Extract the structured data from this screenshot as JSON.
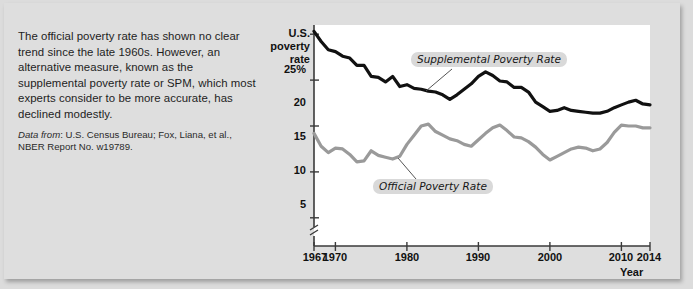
{
  "blurb": {
    "body": "The official poverty rate has shown no clear trend since the late 1960s. However, an alternative measure, known as the supplemental poverty rate or SPM, which most experts consider to be more accurate, has declined modestly.",
    "source_lead": "Data from",
    "source_rest": ": U.S. Census Bureau; Fox, Liana, et al., NBER Report  No. w19789."
  },
  "chart_data": {
    "type": "line",
    "title": "U.S. poverty rate",
    "title_lines": [
      "U.S.",
      "poverty",
      "rate"
    ],
    "xlabel": "Year",
    "ylabel": "U.S. poverty rate",
    "ylim": [
      4,
      26
    ],
    "xlim": [
      1967,
      2014
    ],
    "grid": false,
    "y_axis_break": true,
    "legend_position": "inline-callouts",
    "ytick_labels": [
      "25%",
      "20",
      "15",
      "10",
      "5"
    ],
    "ytick_values": [
      25,
      20,
      15,
      10,
      5
    ],
    "xtick_labels": [
      "1967",
      "1970",
      "1980",
      "1990",
      "2000",
      "2010",
      "2014"
    ],
    "xtick_values": [
      1967,
      1970,
      1980,
      1990,
      2000,
      2010,
      2014
    ],
    "x": [
      1967,
      1968,
      1969,
      1970,
      1971,
      1972,
      1973,
      1974,
      1975,
      1976,
      1977,
      1978,
      1979,
      1980,
      1981,
      1982,
      1983,
      1984,
      1985,
      1986,
      1987,
      1988,
      1989,
      1990,
      1991,
      1992,
      1993,
      1994,
      1995,
      1996,
      1997,
      1998,
      1999,
      2000,
      2001,
      2002,
      2003,
      2004,
      2005,
      2006,
      2007,
      2008,
      2009,
      2010,
      2011,
      2012,
      2013,
      2014
    ],
    "series": [
      {
        "name": "Supplemental Poverty Rate",
        "color": "#111111",
        "values": [
          25.3,
          24.2,
          23.3,
          23.1,
          22.6,
          22.4,
          21.6,
          21.6,
          20.4,
          20.3,
          19.8,
          20.4,
          19.3,
          19.5,
          19.1,
          19.0,
          18.8,
          18.7,
          18.4,
          17.9,
          18.4,
          19.0,
          19.6,
          20.4,
          20.9,
          20.5,
          19.9,
          19.8,
          19.2,
          19.2,
          18.7,
          17.6,
          17.1,
          16.6,
          16.7,
          17.0,
          16.7,
          16.6,
          16.5,
          16.4,
          16.4,
          16.6,
          17.0,
          17.3,
          17.6,
          17.8,
          17.4,
          17.3
        ]
      },
      {
        "name": "Official Poverty Rate",
        "color": "#9a9a9a",
        "values": [
          14.2,
          12.8,
          12.1,
          12.6,
          12.5,
          11.9,
          11.1,
          11.2,
          12.3,
          11.8,
          11.6,
          11.4,
          11.7,
          13.0,
          14.0,
          15.0,
          15.2,
          14.4,
          14.0,
          13.6,
          13.4,
          13.0,
          12.8,
          13.5,
          14.2,
          14.8,
          15.1,
          14.5,
          13.8,
          13.7,
          13.3,
          12.7,
          11.9,
          11.3,
          11.7,
          12.1,
          12.5,
          12.7,
          12.6,
          12.3,
          12.5,
          13.2,
          14.3,
          15.1,
          15.0,
          15.0,
          14.8,
          14.8
        ]
      }
    ],
    "annotations": [
      {
        "text": "Supplemental Poverty Rate",
        "anchor_x": 1991,
        "anchor_y": 20.6
      },
      {
        "text": "Official Poverty Rate",
        "anchor_x": 1983.5,
        "anchor_y": 14.0
      }
    ]
  }
}
